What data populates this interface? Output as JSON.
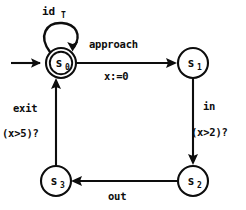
{
  "diagram": {
    "kind": "finite-state-automaton",
    "background_color": "#ffffff",
    "ink_color": "#0d0d0d",
    "states": [
      {
        "id": "s0",
        "label_base": "s",
        "label_sub": "0",
        "shape": "double-circle",
        "is_initial": true,
        "is_accepting": true,
        "cx": 61,
        "cy": 63,
        "r": 15
      },
      {
        "id": "s1",
        "label_base": "s",
        "label_sub": "1",
        "shape": "circle",
        "is_initial": false,
        "is_accepting": false,
        "cx": 193,
        "cy": 63,
        "r": 15
      },
      {
        "id": "s2",
        "label_base": "s",
        "label_sub": "2",
        "shape": "circle",
        "is_initial": false,
        "is_accepting": false,
        "cx": 193,
        "cy": 181,
        "r": 15
      },
      {
        "id": "s3",
        "label_base": "s",
        "label_sub": "3",
        "shape": "circle",
        "is_initial": false,
        "is_accepting": false,
        "cx": 56,
        "cy": 181,
        "r": 15
      }
    ],
    "initial_arrow": {
      "from_x": 11,
      "to_x": 44,
      "y": 63
    },
    "self_loop": {
      "on_state": "s0",
      "label_base": "id",
      "label_sub": "T",
      "label_full": "id_T",
      "label_x": 42,
      "label_y": 15,
      "sub_x": 61,
      "sub_y": 18
    },
    "transitions": [
      {
        "id": "t-s0-s1",
        "from": "s0",
        "to": "s1",
        "event": "approach",
        "guard_or_action": "x:=0",
        "event_x": 89,
        "event_y": 48,
        "action_x": 104,
        "action_y": 80,
        "direction": "right"
      },
      {
        "id": "t-s1-s2",
        "from": "s1",
        "to": "s2",
        "event": "in",
        "guard_or_action": "(x>2)?",
        "event_x": 203,
        "event_y": 110,
        "action_x": 191,
        "action_y": 136,
        "direction": "down"
      },
      {
        "id": "t-s2-s3",
        "from": "s2",
        "to": "s3",
        "event": "out",
        "guard_or_action": "",
        "event_x": 108,
        "event_y": 200,
        "action_x": 0,
        "action_y": 0,
        "direction": "left"
      },
      {
        "id": "t-s3-s0",
        "from": "s3",
        "to": "s0",
        "event": "exit",
        "guard_or_action": "(x>5)?",
        "event_x": 13,
        "event_y": 112,
        "action_x": 2,
        "action_y": 137,
        "direction": "up"
      }
    ]
  }
}
